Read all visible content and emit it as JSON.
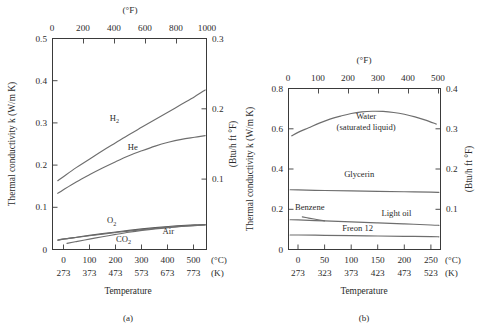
{
  "figure": {
    "captions": {
      "a": "(a)",
      "b": "(b)"
    }
  },
  "chart_data": [
    {
      "id": "gases",
      "type": "line",
      "title": "",
      "caption": "(a)",
      "xlabel": "Temperature",
      "ylabel": "Thermal conductivity k (W/m K)",
      "ylabel_right": "(Btu/h ft °F)",
      "xlabel_top_unit": "(°F)",
      "xunit_c": "(°C)",
      "xunit_k": "(K)",
      "xlim_c": [
        -40,
        545
      ],
      "ylim": [
        0,
        0.5
      ],
      "ylim_right": [
        0,
        0.3
      ],
      "xlim_f": [
        -40,
        1013
      ],
      "grid": false,
      "legend": "inline-labels",
      "xticks_c": [
        "0",
        "100",
        "200",
        "300",
        "400",
        "500"
      ],
      "xticks_c_values": [
        0,
        100,
        200,
        300,
        400,
        500
      ],
      "xticks_k": [
        "273",
        "373",
        "473",
        "573",
        "673",
        "773"
      ],
      "xticks_k_values": [
        273,
        373,
        473,
        573,
        673,
        773
      ],
      "xticks_f": [
        "0",
        "200",
        "400",
        "600",
        "800",
        "1000"
      ],
      "xticks_f_values": [
        0,
        200,
        400,
        600,
        800,
        1000
      ],
      "yticks": [
        "0",
        "0.1",
        "0.2",
        "0.3",
        "0.4",
        "0.5"
      ],
      "yticks_values": [
        0,
        0.1,
        0.2,
        0.3,
        0.4,
        0.5
      ],
      "yticks_right": [
        "0.1",
        "0.2",
        "0.3"
      ],
      "yticks_right_values": [
        0.1,
        0.2,
        0.3
      ],
      "series": [
        {
          "name": "H2",
          "label_main": "H",
          "label_sub": "2",
          "label_x_c": 195,
          "label_y_k": 0.305,
          "points": [
            [
              -20,
              0.163
            ],
            [
              0,
              0.172
            ],
            [
              50,
              0.194
            ],
            [
              100,
              0.214
            ],
            [
              150,
              0.234
            ],
            [
              200,
              0.253
            ],
            [
              250,
              0.272
            ],
            [
              300,
              0.29
            ],
            [
              350,
              0.308
            ],
            [
              400,
              0.326
            ],
            [
              450,
              0.344
            ],
            [
              500,
              0.362
            ],
            [
              540,
              0.378
            ]
          ]
        },
        {
          "name": "He",
          "label_main": "He",
          "label_sub": "",
          "label_x_c": 265,
          "label_y_k": 0.236,
          "points": [
            [
              -20,
              0.133
            ],
            [
              0,
              0.141
            ],
            [
              50,
              0.16
            ],
            [
              100,
              0.177
            ],
            [
              150,
              0.193
            ],
            [
              200,
              0.208
            ],
            [
              250,
              0.222
            ],
            [
              300,
              0.234
            ],
            [
              350,
              0.245
            ],
            [
              400,
              0.254
            ],
            [
              450,
              0.261
            ],
            [
              500,
              0.266
            ],
            [
              540,
              0.27
            ]
          ]
        },
        {
          "name": "O2",
          "label_main": "O",
          "label_sub": "2",
          "label_x_c": 185,
          "label_y_k": 0.062,
          "points": [
            [
              -20,
              0.022
            ],
            [
              0,
              0.0245
            ],
            [
              50,
              0.029
            ],
            [
              100,
              0.0333
            ],
            [
              150,
              0.0375
            ],
            [
              200,
              0.0415
            ],
            [
              250,
              0.0453
            ],
            [
              300,
              0.0488
            ],
            [
              350,
              0.0518
            ],
            [
              400,
              0.0545
            ],
            [
              450,
              0.0567
            ],
            [
              500,
              0.0583
            ],
            [
              540,
              0.0593
            ]
          ]
        },
        {
          "name": "Air",
          "label_main": "Air",
          "label_sub": "",
          "label_x_c": 400,
          "label_y_k": 0.0365,
          "points": [
            [
              -20,
              0.0225
            ],
            [
              0,
              0.0245
            ],
            [
              50,
              0.0285
            ],
            [
              100,
              0.0325
            ],
            [
              150,
              0.0365
            ],
            [
              200,
              0.0402
            ],
            [
              250,
              0.0437
            ],
            [
              300,
              0.047
            ],
            [
              350,
              0.05
            ],
            [
              400,
              0.0527
            ],
            [
              450,
              0.0551
            ],
            [
              500,
              0.0571
            ],
            [
              540,
              0.0585
            ]
          ]
        },
        {
          "name": "CO2",
          "label_main": "CO",
          "label_sub": "2",
          "label_x_c": 230,
          "label_y_k": 0.0185,
          "points": [
            [
              15,
              0.0145
            ],
            [
              50,
              0.0187
            ],
            [
              100,
              0.0245
            ],
            [
              150,
              0.0303
            ],
            [
              200,
              0.0357
            ],
            [
              250,
              0.0408
            ],
            [
              300,
              0.0452
            ],
            [
              350,
              0.049
            ],
            [
              400,
              0.052
            ],
            [
              450,
              0.0545
            ],
            [
              500,
              0.0565
            ],
            [
              540,
              0.058
            ]
          ]
        }
      ]
    },
    {
      "id": "liquids",
      "type": "line",
      "title": "",
      "caption": "(b)",
      "xlabel": "Temperature",
      "ylabel": "Thermal conductivity k (W/m K)",
      "ylabel_right": "(Btu/h ft °F)",
      "xlabel_top_unit": "(°F)",
      "xunit_c": "(°C)",
      "xunit_k": "(K)",
      "xlim_c": [
        -18,
        268
      ],
      "ylim": [
        0,
        0.8
      ],
      "ylim_right": [
        0,
        0.4
      ],
      "xlim_f": [
        0,
        514
      ],
      "grid": false,
      "legend": "inline-labels",
      "xticks_c": [
        "0",
        "50",
        "100",
        "150",
        "200",
        "250"
      ],
      "xticks_c_values": [
        0,
        50,
        100,
        150,
        200,
        250
      ],
      "xticks_k": [
        "273",
        "323",
        "373",
        "423",
        "473",
        "523"
      ],
      "xticks_k_values": [
        273,
        323,
        373,
        423,
        473,
        523
      ],
      "xticks_f": [
        "0",
        "100",
        "200",
        "300",
        "400",
        "500"
      ],
      "xticks_f_values": [
        0,
        100,
        200,
        300,
        400,
        500
      ],
      "yticks": [
        "0",
        "0.2",
        "0.4",
        "0.6",
        "0.8"
      ],
      "yticks_values": [
        0,
        0.2,
        0.4,
        0.6,
        0.8
      ],
      "yticks_right": [
        "0.1",
        "0.2",
        "0.3",
        "0.4"
      ],
      "yticks_right_values": [
        0.1,
        0.2,
        0.3,
        0.4
      ],
      "series": [
        {
          "name": "Water (saturated liquid)",
          "label_main": "Water",
          "label_sub": "(saturated liquid)",
          "label_x_c": 128,
          "label_y_k": 0.648,
          "points": [
            [
              -12,
              0.565
            ],
            [
              0,
              0.582
            ],
            [
              20,
              0.605
            ],
            [
              40,
              0.628
            ],
            [
              60,
              0.648
            ],
            [
              80,
              0.663
            ],
            [
              100,
              0.676
            ],
            [
              120,
              0.684
            ],
            [
              140,
              0.687
            ],
            [
              160,
              0.686
            ],
            [
              180,
              0.681
            ],
            [
              200,
              0.672
            ],
            [
              220,
              0.659
            ],
            [
              240,
              0.643
            ],
            [
              260,
              0.623
            ]
          ]
        },
        {
          "name": "Glycerin",
          "label_main": "Glycerin",
          "label_sub": "",
          "label_x_c": 115,
          "label_y_k": 0.358,
          "points": [
            [
              -15,
              0.297
            ],
            [
              0,
              0.296
            ],
            [
              50,
              0.293
            ],
            [
              100,
              0.291
            ],
            [
              150,
              0.289
            ],
            [
              200,
              0.287
            ],
            [
              250,
              0.285
            ],
            [
              265,
              0.284
            ]
          ]
        },
        {
          "name": "Benzene",
          "label_main": "Benzene",
          "label_sub": "",
          "label_x_c": 22,
          "label_y_k": 0.196,
          "points": [
            [
              8,
              0.162
            ],
            [
              20,
              0.156
            ],
            [
              35,
              0.149
            ],
            [
              50,
              0.142
            ]
          ]
        },
        {
          "name": "Light oil",
          "label_main": "Light oil",
          "label_sub": "",
          "label_x_c": 185,
          "label_y_k": 0.166,
          "points": [
            [
              -15,
              0.148
            ],
            [
              0,
              0.147
            ],
            [
              50,
              0.142
            ],
            [
              100,
              0.137
            ],
            [
              150,
              0.132
            ],
            [
              200,
              0.127
            ],
            [
              250,
              0.122
            ],
            [
              265,
              0.12
            ]
          ]
        },
        {
          "name": "Freon 12",
          "label_main": "Freon 12",
          "label_sub": "",
          "label_x_c": 112,
          "label_y_k": 0.092,
          "points": [
            [
              -15,
              0.072
            ],
            [
              0,
              0.072
            ],
            [
              50,
              0.0705
            ],
            [
              100,
              0.069
            ],
            [
              150,
              0.0672
            ],
            [
              200,
              0.0655
            ],
            [
              250,
              0.0638
            ],
            [
              265,
              0.063
            ]
          ]
        }
      ]
    }
  ]
}
